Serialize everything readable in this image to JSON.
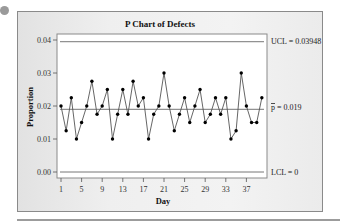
{
  "chart_data": {
    "type": "line",
    "title": "P Chart of Defects",
    "xlabel": "Day",
    "ylabel": "Proportion",
    "x": [
      1,
      2,
      3,
      4,
      5,
      6,
      7,
      8,
      9,
      10,
      11,
      12,
      13,
      14,
      15,
      16,
      17,
      18,
      19,
      20,
      21,
      22,
      23,
      24,
      25,
      26,
      27,
      28,
      29,
      30,
      31,
      32,
      33,
      34,
      35,
      36,
      37,
      38,
      39,
      40
    ],
    "series": [
      {
        "name": "Proportion",
        "values": [
          0.02,
          0.0125,
          0.0225,
          0.01,
          0.015,
          0.02,
          0.0275,
          0.0175,
          0.02,
          0.025,
          0.01,
          0.0175,
          0.025,
          0.0175,
          0.0275,
          0.02,
          0.0225,
          0.01,
          0.0175,
          0.02,
          0.03,
          0.02,
          0.0125,
          0.0175,
          0.0225,
          0.015,
          0.02,
          0.025,
          0.015,
          0.0175,
          0.0225,
          0.0175,
          0.0225,
          0.01,
          0.0125,
          0.03,
          0.02,
          0.015,
          0.015,
          0.0225
        ]
      }
    ],
    "x_ticks": [
      1,
      5,
      9,
      13,
      17,
      21,
      25,
      29,
      33,
      37
    ],
    "y_ticks": [
      "0.00",
      "0.01",
      "0.02",
      "0.03",
      "0.04"
    ],
    "ylim": [
      0,
      0.04
    ],
    "control_limits": {
      "UCL": 0.03948,
      "center": 0.019,
      "LCL": 0
    },
    "annotations": [
      "UCL = 0.03948",
      "p̄ = 0.019",
      "LCL = 0"
    ],
    "grid": false,
    "legend": "none"
  },
  "labels": {
    "title": "P Chart of Defects",
    "xlabel": "Day",
    "ylabel": "Proportion",
    "ucl": "UCL = 0.03948",
    "center_prefix": "p",
    "center_value": " = 0.019",
    "lcl": "LCL = 0"
  }
}
